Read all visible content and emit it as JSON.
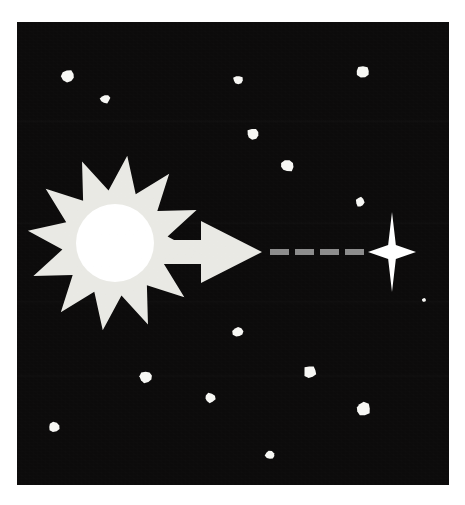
{
  "canvas": {
    "width": 465,
    "height": 505,
    "background_color": "#ffffff"
  },
  "sky_panel": {
    "label": "night-sky",
    "x": 17,
    "y": 22,
    "width": 432,
    "height": 463,
    "fill_color": "#0c0b0b"
  },
  "sun": {
    "label": "sun",
    "center_x": 115,
    "center_y": 243,
    "burst_points": 12,
    "outer_radius": 88,
    "inner_radius": 53,
    "burst_color": "#e9e9e4",
    "core_radius": 39,
    "core_color": "#ffffff",
    "rotation_deg": 8
  },
  "arrow": {
    "label": "direction-arrow",
    "color": "#e9e9e4",
    "start_x": 100,
    "tip_x": 262,
    "center_y": 252,
    "shaft_half_height": 12,
    "head_half_height": 31,
    "head_start_x": 201
  },
  "dashes": {
    "label": "travel-path",
    "color": "#8c8c8c",
    "center_y": 252,
    "thickness": 6,
    "segments": [
      {
        "x": 270,
        "width": 19
      },
      {
        "x": 295,
        "width": 19
      },
      {
        "x": 320,
        "width": 19
      },
      {
        "x": 345,
        "width": 19
      }
    ]
  },
  "destination_star": {
    "label": "destination-star",
    "center_x": 392,
    "center_y": 252,
    "half_width": 24,
    "half_height": 40,
    "waist": 7,
    "color": "#ffffff"
  },
  "background_stars": {
    "label": "background-stars",
    "color": "#f7f7f4",
    "count": 15,
    "items": [
      {
        "cx": 68,
        "cy": 76,
        "rx": 7.0,
        "ry": 6.5,
        "rot": 18
      },
      {
        "cx": 105,
        "cy": 99,
        "rx": 5.0,
        "ry": 4.4,
        "rot": -14
      },
      {
        "cx": 238,
        "cy": 80,
        "rx": 5.0,
        "ry": 4.6,
        "rot": 7
      },
      {
        "cx": 363,
        "cy": 72,
        "rx": 7.0,
        "ry": 6.2,
        "rot": 30
      },
      {
        "cx": 253,
        "cy": 134,
        "rx": 6.2,
        "ry": 5.6,
        "rot": -22
      },
      {
        "cx": 287,
        "cy": 166,
        "rx": 6.8,
        "ry": 6.0,
        "rot": 11
      },
      {
        "cx": 360,
        "cy": 202,
        "rx": 4.2,
        "ry": 5.2,
        "rot": 4
      },
      {
        "cx": 238,
        "cy": 332,
        "rx": 5.6,
        "ry": 5.2,
        "rot": -9
      },
      {
        "cx": 146,
        "cy": 377,
        "rx": 6.4,
        "ry": 6.0,
        "rot": 26
      },
      {
        "cx": 310,
        "cy": 372,
        "rx": 6.6,
        "ry": 6.2,
        "rot": -18
      },
      {
        "cx": 210,
        "cy": 398,
        "rx": 5.4,
        "ry": 5.0,
        "rot": 13
      },
      {
        "cx": 363,
        "cy": 409,
        "rx": 7.4,
        "ry": 6.8,
        "rot": -5
      },
      {
        "cx": 54,
        "cy": 427,
        "rx": 5.6,
        "ry": 5.0,
        "rot": 21
      },
      {
        "cx": 270,
        "cy": 455,
        "rx": 4.8,
        "ry": 4.4,
        "rot": -27
      },
      {
        "cx": 424,
        "cy": 300,
        "rx": 2.0,
        "ry": 2.0,
        "rot": 0
      }
    ]
  }
}
